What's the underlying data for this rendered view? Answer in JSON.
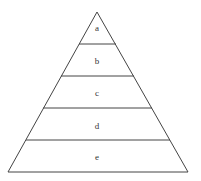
{
  "diagram": {
    "type": "pyramid",
    "levels": [
      {
        "label": "a"
      },
      {
        "label": "b"
      },
      {
        "label": "c"
      },
      {
        "label": "d"
      },
      {
        "label": "e"
      }
    ],
    "stroke_color": "#444444"
  }
}
